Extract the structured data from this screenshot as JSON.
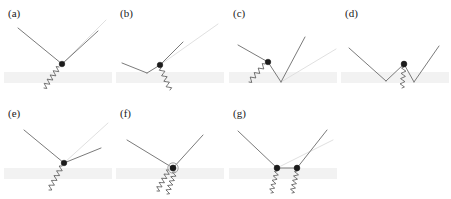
{
  "figure": {
    "width": 451,
    "height": 199,
    "background_color": "#ffffff",
    "colors": {
      "solid_line": "#6b6b6b",
      "faint_line": "#dcdcdc",
      "wavy_line": "#5a5a5a",
      "vertex": "#1c1c1c",
      "surface_band": "#f2f2f2",
      "label_text": "#1a1a1a"
    }
  },
  "panels": [
    {
      "id": "a",
      "label": "(a)",
      "label_x": 8,
      "label_y": 8,
      "origin_x": 0,
      "origin_y": 0,
      "band": {
        "x": 4,
        "y": 72,
        "width": 108,
        "height": 11
      },
      "solid_paths": [
        "M 18,28 L 62,64",
        "M 62,64 L 98,31"
      ],
      "faint_paths": [
        "M 62,64 L 106,20"
      ],
      "wavy": {
        "start_x": 59,
        "start_y": 67,
        "end_x": 44,
        "end_y": 88,
        "amplitude": 2.6,
        "cycles": 5
      },
      "vertices": [
        {
          "cx": 62,
          "cy": 64,
          "r": 2.8,
          "ring": false
        }
      ]
    },
    {
      "id": "b",
      "label": "(b)",
      "label_x": 120,
      "label_y": 8,
      "origin_x": 112,
      "origin_y": 0,
      "band": {
        "x": 116,
        "y": 72,
        "width": 108,
        "height": 11
      },
      "solid_paths": [
        "M 122,63 L 147,73",
        "M 147,73 L 160,65",
        "M 160,65 L 183,42"
      ],
      "faint_paths": [
        "M 160,65 L 218,24"
      ],
      "wavy": {
        "start_x": 161,
        "start_y": 68,
        "end_x": 170,
        "end_y": 90,
        "amplitude": 2.4,
        "cycles": 4
      },
      "vertices": [
        {
          "cx": 160,
          "cy": 65,
          "r": 2.8,
          "ring": false
        }
      ]
    },
    {
      "id": "c",
      "label": "(c)",
      "label_x": 233,
      "label_y": 8,
      "origin_x": 225,
      "origin_y": 0,
      "band": {
        "x": 229,
        "y": 72,
        "width": 108,
        "height": 11
      },
      "solid_paths": [
        "M 238,45 L 268,62",
        "M 268,62 L 281,82",
        "M 281,82 L 305,37"
      ],
      "faint_paths": [
        "M 281,82 L 336,49"
      ],
      "wavy": {
        "start_x": 265,
        "start_y": 64,
        "end_x": 249,
        "end_y": 82,
        "amplitude": 2.4,
        "cycles": 4
      },
      "vertices": [
        {
          "cx": 268,
          "cy": 62,
          "r": 2.8,
          "ring": false
        }
      ]
    },
    {
      "id": "d",
      "label": "(d)",
      "label_x": 345,
      "label_y": 8,
      "origin_x": 337,
      "origin_y": 0,
      "band": {
        "x": 341,
        "y": 72,
        "width": 108,
        "height": 11
      },
      "solid_paths": [
        "M 349,48 L 386,81",
        "M 386,81 L 404,64",
        "M 404,64 L 414,82",
        "M 414,82 L 439,46"
      ],
      "faint_paths": [],
      "wavy": {
        "start_x": 404,
        "start_y": 67,
        "end_x": 402,
        "end_y": 88,
        "amplitude": 2.3,
        "cycles": 4
      },
      "vertices": [
        {
          "cx": 404,
          "cy": 64,
          "r": 2.9,
          "ring": false
        }
      ]
    },
    {
      "id": "e",
      "label": "(e)",
      "label_x": 8,
      "label_y": 108,
      "origin_x": 0,
      "origin_y": 100,
      "band": {
        "x": 4,
        "y": 168,
        "width": 108,
        "height": 11
      },
      "solid_paths": [
        "M 24,130 L 64,163",
        "M 64,163 L 101,148"
      ],
      "faint_paths": [
        "M 64,163 L 108,123"
      ],
      "wavy": {
        "start_x": 62,
        "start_y": 166,
        "end_x": 49,
        "end_y": 190,
        "amplitude": 2.5,
        "cycles": 5
      },
      "vertices": [
        {
          "cx": 64,
          "cy": 163,
          "r": 2.8,
          "ring": false
        }
      ]
    },
    {
      "id": "f",
      "label": "(f)",
      "label_x": 120,
      "label_y": 108,
      "origin_x": 112,
      "origin_y": 100,
      "band": {
        "x": 116,
        "y": 168,
        "width": 108,
        "height": 11
      },
      "solid_paths": [
        "M 127,140 L 173,168",
        "M 173,168 L 203,135"
      ],
      "faint_paths": [],
      "wavy": {
        "start_x": 169,
        "start_y": 170,
        "end_x": 157,
        "end_y": 191,
        "amplitude": 2.4,
        "cycles": 5
      },
      "wavy2": {
        "start_x": 175,
        "start_y": 172,
        "end_x": 167,
        "end_y": 194,
        "amplitude": 2.4,
        "cycles": 5
      },
      "vertices": [
        {
          "cx": 173,
          "cy": 168,
          "r": 3.0,
          "ring": true,
          "ring_r": 5.2
        }
      ]
    },
    {
      "id": "g",
      "label": "(g)",
      "label_x": 233,
      "label_y": 108,
      "origin_x": 225,
      "origin_y": 100,
      "band": {
        "x": 229,
        "y": 168,
        "width": 108,
        "height": 11
      },
      "solid_paths": [
        "M 238,131 L 277,168",
        "M 277,168 L 297,168",
        "M 297,168 L 327,130"
      ],
      "faint_paths": [
        "M 277,168 L 333,140"
      ],
      "wavy": {
        "start_x": 277,
        "start_y": 171,
        "end_x": 271,
        "end_y": 193,
        "amplitude": 2.3,
        "cycles": 5
      },
      "wavy2": {
        "start_x": 297,
        "start_y": 171,
        "end_x": 292,
        "end_y": 193,
        "amplitude": 2.3,
        "cycles": 5
      },
      "vertices": [
        {
          "cx": 277,
          "cy": 168,
          "r": 2.9,
          "ring": false
        },
        {
          "cx": 297,
          "cy": 168,
          "r": 2.9,
          "ring": false
        }
      ]
    }
  ]
}
